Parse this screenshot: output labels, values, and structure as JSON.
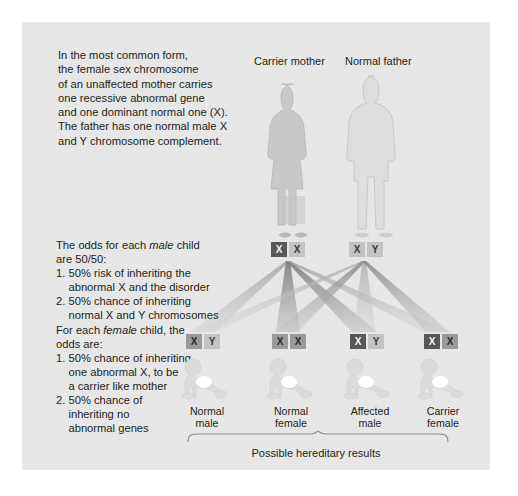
{
  "figure": {
    "background_color": "#e8e8e8",
    "page_color": "#ffffff"
  },
  "intro_text": "In the most common form,\nthe female sex chromosome\nof an unaffected mother carries\none recessive abnormal gene\nand one dominant normal one (X).\nThe father has one normal male X\nand Y chromosome complement.",
  "odds_text": {
    "line1a": "The odds for each ",
    "line1_em": "male",
    "line1b": " child",
    "line2": "are 50/50:",
    "line3": "1. 50% risk of inheriting the",
    "line4": "    abnormal X and the disorder",
    "line5": "2. 50% chance of inheriting",
    "line6": "    normal X and Y chromosomes",
    "line7a": "For each ",
    "line7_em": "female",
    "line7b": " child, the",
    "line8": "odds are:",
    "line9": "1. 50% chance of inheriting",
    "line10": "    one abnormal X, to be",
    "line11": "    a carrier like mother",
    "line12": "2. 50% chance of",
    "line13": "    inheriting no",
    "line14": "    abnormal genes"
  },
  "parents": [
    {
      "id": "mother",
      "label": "Carrier mother",
      "figure_icon": "female-silhouette-icon",
      "chromosomes": [
        {
          "letter": "X",
          "state": "abnormal",
          "shade": "dark"
        },
        {
          "letter": "X",
          "state": "normal",
          "shade": "light"
        }
      ]
    },
    {
      "id": "father",
      "label": "Normal father",
      "figure_icon": "male-silhouette-icon",
      "chromosomes": [
        {
          "letter": "X",
          "state": "normal",
          "shade": "light"
        },
        {
          "letter": "Y",
          "state": "normal",
          "shade": "light"
        }
      ]
    }
  ],
  "children": [
    {
      "id": "child-1",
      "label_line1": "Normal",
      "label_line2": "male",
      "baby_icon": "crawling-baby-icon",
      "chromosomes": [
        {
          "letter": "X",
          "state": "normal",
          "shade": "mid"
        },
        {
          "letter": "Y",
          "state": "normal",
          "shade": "light"
        }
      ]
    },
    {
      "id": "child-2",
      "label_line1": "Normal",
      "label_line2": "female",
      "baby_icon": "crawling-baby-icon",
      "chromosomes": [
        {
          "letter": "X",
          "state": "normal",
          "shade": "mid"
        },
        {
          "letter": "X",
          "state": "normal",
          "shade": "mid"
        }
      ]
    },
    {
      "id": "child-3",
      "label_line1": "Affected",
      "label_line2": "male",
      "baby_icon": "crawling-baby-icon",
      "chromosomes": [
        {
          "letter": "X",
          "state": "abnormal",
          "shade": "dark"
        },
        {
          "letter": "Y",
          "state": "normal",
          "shade": "light"
        }
      ]
    },
    {
      "id": "child-4",
      "label_line1": "Carrier",
      "label_line2": "female",
      "baby_icon": "crawling-baby-icon",
      "chromosomes": [
        {
          "letter": "X",
          "state": "abnormal",
          "shade": "dark"
        },
        {
          "letter": "X",
          "state": "normal",
          "shade": "mid"
        }
      ]
    }
  ],
  "caption": "Possible hereditary results",
  "colors": {
    "abnormal_chromosome": "#58585a",
    "normal_chromosome_mid": "#9a9a9c",
    "normal_chromosome_light": "#c3c3c4",
    "text": "#231f20",
    "mother_figure": "#c9c9c9",
    "father_figure": "#dcdcdc",
    "baby_figure": "#dbdbdb"
  }
}
